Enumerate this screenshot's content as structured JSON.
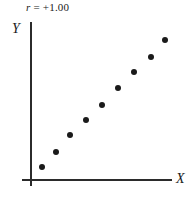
{
  "figure": {
    "title_symbol": "r",
    "title_value": " = +1.00",
    "title_full": "r = +1.00",
    "background_color": "#ffffff",
    "axis_color": "#2b2b2b",
    "point_color": "#1a1a1a"
  },
  "axes": {
    "y_label": "Y",
    "x_label": "X"
  },
  "chart_data": {
    "type": "scatter",
    "title": "r = +1.00",
    "xlabel": "X",
    "ylabel": "Y",
    "grid": false,
    "legend": null,
    "annotations": [
      "r = +1.00"
    ],
    "correlation": 1.0,
    "xlim": [
      0,
      10
    ],
    "ylim": [
      0,
      10
    ],
    "axis_ticks": false,
    "points": [
      {
        "x": 1.0,
        "y": 1.0,
        "px": 42,
        "py": 167
      },
      {
        "x": 2.0,
        "y": 2.0,
        "px": 56,
        "py": 152
      },
      {
        "x": 3.0,
        "y": 3.0,
        "px": 70,
        "py": 135
      },
      {
        "x": 4.0,
        "y": 4.0,
        "px": 86,
        "py": 120
      },
      {
        "x": 5.0,
        "y": 5.0,
        "px": 102,
        "py": 105
      },
      {
        "x": 6.0,
        "y": 6.0,
        "px": 118,
        "py": 88
      },
      {
        "x": 7.0,
        "y": 7.0,
        "px": 134,
        "py": 72
      },
      {
        "x": 8.0,
        "y": 8.0,
        "px": 151,
        "py": 57
      },
      {
        "x": 9.0,
        "y": 9.0,
        "px": 165,
        "py": 40
      }
    ],
    "x": [
      1.0,
      2.0,
      3.0,
      4.0,
      5.0,
      6.0,
      7.0,
      8.0,
      9.0
    ],
    "y": [
      1.0,
      2.0,
      3.0,
      4.0,
      5.0,
      6.0,
      7.0,
      8.0,
      9.0
    ]
  }
}
